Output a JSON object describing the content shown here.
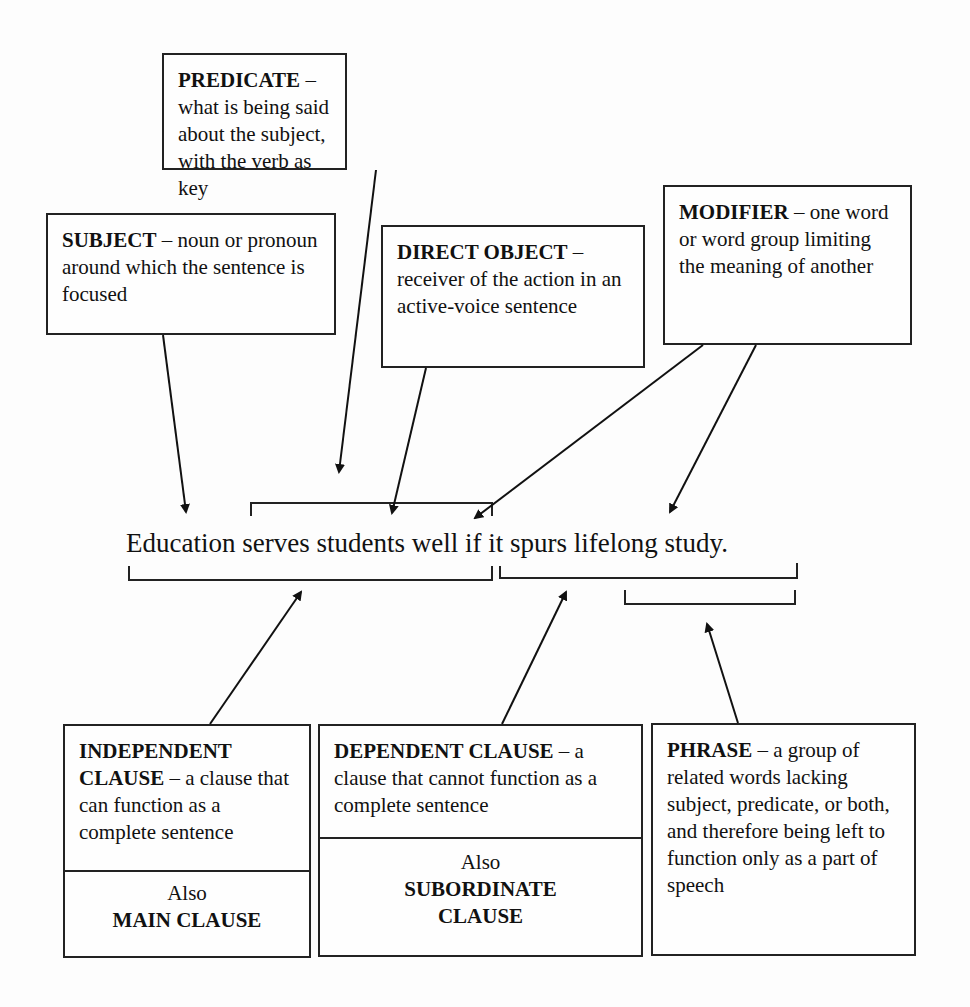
{
  "diagram": {
    "sentence": "Education serves students well if it spurs lifelong study.",
    "top_boxes": [
      {
        "id": "predicate",
        "term": "PREDICATE",
        "definition": " – what is being said about the subject, with the verb as key"
      },
      {
        "id": "subject",
        "term": "SUBJECT",
        "definition": " – noun or pronoun around which the sentence is focused"
      },
      {
        "id": "direct_object",
        "term": "DIRECT OBJECT",
        "definition": " – receiver of the action in an active-voice sentence"
      },
      {
        "id": "modifier",
        "term": "MODIFIER",
        "definition": " – one word or word group limiting the meaning of another"
      }
    ],
    "bottom_boxes": [
      {
        "id": "independent_clause",
        "term": "INDEPENDENT CLAUSE",
        "definition": " – a clause that can function as a complete sentence",
        "also_label": "Also",
        "also_term": "MAIN CLAUSE"
      },
      {
        "id": "dependent_clause",
        "term": "DEPENDENT CLAUSE",
        "definition": " – a clause that cannot function as a complete sentence",
        "also_label": "Also",
        "also_term": "SUBORDINATE CLAUSE"
      },
      {
        "id": "phrase",
        "term": "PHRASE",
        "definition": " – a group of related words lacking subject, predicate, or both, and therefore being left to function only as a part of speech"
      }
    ]
  }
}
